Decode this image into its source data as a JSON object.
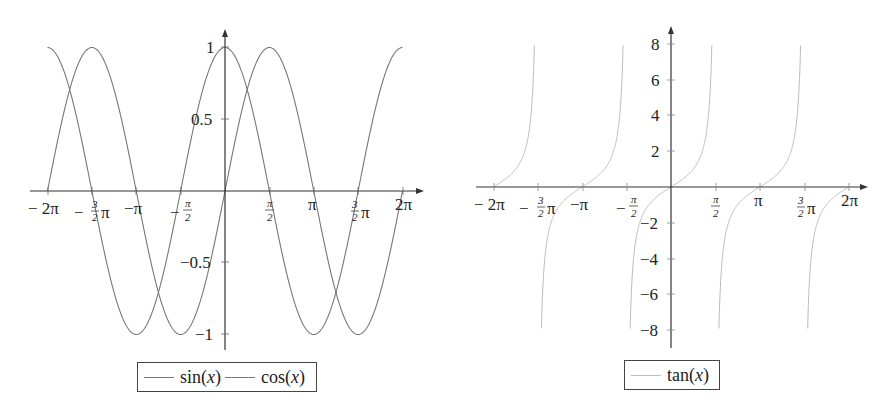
{
  "chart_data": [
    {
      "type": "line",
      "title": "",
      "xlabel": "",
      "ylabel": "",
      "x_range": [
        -6.2832,
        6.2832
      ],
      "ylim": [
        -1,
        1
      ],
      "grid": false,
      "legend_position": "below",
      "x_tick_labels": [
        "− 2π",
        "−3/2π",
        "−π",
        "−π/2",
        "π/2",
        "π",
        "3/2π",
        "2π"
      ],
      "x_ticks": [
        -6.2832,
        -4.7124,
        -3.1416,
        -1.5708,
        1.5708,
        3.1416,
        4.7124,
        6.2832
      ],
      "y_tick_labels": [
        "1",
        "0.5",
        "−0.5",
        "−1"
      ],
      "y_ticks": [
        1,
        0.5,
        -0.5,
        -1
      ],
      "series": [
        {
          "name": "sin(x)",
          "function": "sin",
          "color": "#777777",
          "x": [
            -6.2832,
            -4.7124,
            -3.1416,
            -1.5708,
            0,
            1.5708,
            3.1416,
            4.7124,
            6.2832
          ],
          "values": [
            0,
            1,
            0,
            -1,
            0,
            1,
            0,
            -1,
            0
          ]
        },
        {
          "name": "cos(x)",
          "function": "cos",
          "color": "#777777",
          "x": [
            -6.2832,
            -4.7124,
            -3.1416,
            -1.5708,
            0,
            1.5708,
            3.1416,
            4.7124,
            6.2832
          ],
          "values": [
            1,
            0,
            -1,
            0,
            1,
            0,
            -1,
            0,
            1
          ]
        }
      ]
    },
    {
      "type": "line",
      "title": "",
      "xlabel": "",
      "ylabel": "",
      "x_range": [
        -6.2832,
        6.2832
      ],
      "ylim": [
        -8,
        8
      ],
      "grid": false,
      "legend_position": "below",
      "x_tick_labels": [
        "− 2π",
        "−3/2π",
        "−π",
        "−π/2",
        "π/2",
        "π",
        "3/2π",
        "2π"
      ],
      "x_ticks": [
        -6.2832,
        -4.7124,
        -3.1416,
        -1.5708,
        1.5708,
        3.1416,
        4.7124,
        6.2832
      ],
      "y_tick_labels": [
        "8",
        "6",
        "4",
        "2",
        "−2",
        "−4",
        "−6",
        "−8"
      ],
      "y_ticks": [
        8,
        6,
        4,
        2,
        -2,
        -4,
        -6,
        -8
      ],
      "series": [
        {
          "name": "tan(x)",
          "function": "tan",
          "color": "#bbbbbb",
          "x": [
            -6.2832,
            -5.4978,
            -3.927,
            -3.1416,
            -2.3562,
            -0.7854,
            0,
            0.7854,
            2.3562,
            3.1416,
            3.927,
            5.4978,
            6.2832
          ],
          "values": [
            0,
            1,
            -1,
            0,
            1,
            -1,
            0,
            1,
            -1,
            0,
            1,
            -1,
            0
          ]
        }
      ]
    }
  ],
  "left_chart": {
    "x_labels": {
      "neg2pi": "− 2π",
      "neg32pi_num": "3",
      "neg32pi_den": "2",
      "neg32pi_pre": "−",
      "neg32pi_pi": "π",
      "negpi": "−π",
      "negpihalf_pre": "−",
      "negpihalf_num": "π",
      "negpihalf_den": "2",
      "pihalf_num": "π",
      "pihalf_den": "2",
      "pi": "π",
      "p32pi_num": "3",
      "p32pi_den": "2",
      "p32pi_pi": "π",
      "p2pi": "2π"
    },
    "y_labels": {
      "p1": "1",
      "p05": "0.5",
      "n05": "−0.5",
      "n1": "−1"
    },
    "legend": [
      {
        "label_fn": "sin",
        "label_arg": "x"
      },
      {
        "label_fn": "cos",
        "label_arg": "x"
      }
    ]
  },
  "right_chart": {
    "x_labels": {
      "neg2pi": "− 2π",
      "neg32pi_num": "3",
      "neg32pi_den": "2",
      "neg32pi_pre": "−",
      "neg32pi_pi": "π",
      "negpi": "−π",
      "negpihalf_pre": "−",
      "negpihalf_num": "π",
      "negpihalf_den": "2",
      "pihalf_num": "π",
      "pihalf_den": "2",
      "pi": "π",
      "p32pi_num": "3",
      "p32pi_den": "2",
      "p32pi_pi": "π",
      "p2pi": "2π"
    },
    "y_labels": {
      "p8": "8",
      "p6": "6",
      "p4": "4",
      "p2": "2",
      "n2": "−2",
      "n4": "−4",
      "n6": "−6",
      "n8": "−8"
    },
    "legend": [
      {
        "label_fn": "tan",
        "label_arg": "x"
      }
    ]
  },
  "colors": {
    "axis": "#333333",
    "sin_cos": "#777777",
    "tan": "#bbbbbb"
  }
}
